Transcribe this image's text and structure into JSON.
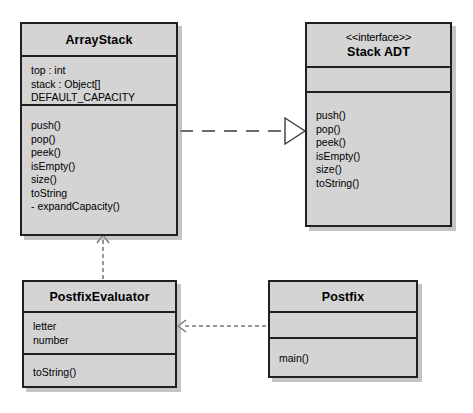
{
  "diagram": {
    "type": "uml-class-diagram",
    "background_color": "#ffffff",
    "class_fill_color": "#d4d4d4",
    "line_color": "#231f20",
    "classes": [
      {
        "id": "array-stack",
        "name": "ArrayStack",
        "stereotype": "",
        "attributes": [
          "top : int",
          "stack : Object[]",
          "DEFAULT_CAPACITY"
        ],
        "operations": [
          "push()",
          "pop()",
          "peek()",
          "isEmpty()",
          "size()",
          "toString",
          "- expandCapacity()"
        ]
      },
      {
        "id": "stack-adt",
        "name": "Stack ADT",
        "stereotype": "<<interface>>",
        "attributes": [],
        "operations": [
          "push()",
          "pop()",
          "peek()",
          "isEmpty()",
          "size()",
          "toString()"
        ]
      },
      {
        "id": "postfix-evaluator",
        "name": "PostfixEvaluator",
        "stereotype": "",
        "attributes": [
          "letter",
          "number"
        ],
        "operations": [
          "toString()"
        ]
      },
      {
        "id": "postfix",
        "name": "Postfix",
        "stereotype": "",
        "attributes": [],
        "operations": [
          "main()"
        ]
      }
    ],
    "relationships": [
      {
        "id": "realization-arraystack-stackadt",
        "kind": "realization",
        "line_style": "dashed",
        "arrow_head": "hollow-triangle",
        "source": "ArrayStack",
        "target": "Stack ADT",
        "direction": "right"
      },
      {
        "id": "dependency-postfixevaluator-arraystack",
        "kind": "dependency",
        "line_style": "dashed",
        "arrow_head": "open",
        "source": "PostfixEvaluator",
        "target": "ArrayStack",
        "direction": "up"
      },
      {
        "id": "dependency-postfix-postfixevaluator",
        "kind": "dependency",
        "line_style": "dashed",
        "arrow_head": "open",
        "source": "Postfix",
        "target": "PostfixEvaluator",
        "direction": "left"
      }
    ]
  }
}
